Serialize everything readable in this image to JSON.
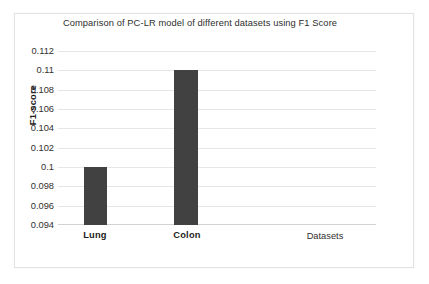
{
  "chart_data": {
    "type": "bar",
    "title": "Comparison of PC-LR model of different datasets using F1 Score",
    "xlabel": "Datasets",
    "ylabel": "F1-score",
    "categories": [
      "Lung",
      "Colon"
    ],
    "values": [
      0.1,
      0.11
    ],
    "series": [
      {
        "name": "F1 Score",
        "values": [
          0.1,
          0.11
        ]
      }
    ],
    "ylim": [
      0.094,
      0.112
    ],
    "ytick_step": 0.002,
    "ytick_labels": [
      "0.112",
      "0.11",
      "0.108",
      "0.106",
      "0.104",
      "0.102",
      "0.1",
      "0.098",
      "0.096",
      "0.094"
    ],
    "ytick_values": [
      0.112,
      0.11,
      0.108,
      0.106,
      0.104,
      0.102,
      0.1,
      0.098,
      0.096,
      0.094
    ],
    "grid": true,
    "grid_axis": "y",
    "legend": false,
    "legend_position": "none",
    "bar_color": "#414141",
    "grid_color": "#e6e6e6",
    "axis_color": "#d2d2d2",
    "plot_background": "#ffffff",
    "frame_color": "#e3e3e3",
    "title_color": "#2e2e2e",
    "tick_label_color": "#33302f",
    "axis_title_color": "#1d1d1b"
  }
}
